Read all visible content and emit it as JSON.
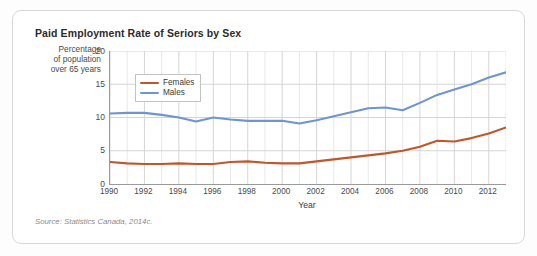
{
  "card": {
    "title": "Paid Employment Rate of Seriors by Sex",
    "source": "Source: Statistics Canada, 2014c."
  },
  "axes": {
    "y_caption": "Percentage of population over 65 years",
    "y_caption_lines": [
      "Percentage",
      "of population",
      "over 65 years"
    ],
    "x_title": "Year"
  },
  "legend": {
    "position": "inside-top-left",
    "entries": [
      {
        "label": "Females",
        "color": "#c0562c"
      },
      {
        "label": "Males",
        "color": "#6e95cf"
      }
    ]
  },
  "chart_data": {
    "type": "line",
    "title": "Paid Employment Rate of Seriors by Sex",
    "xlabel": "Year",
    "ylabel": "Percentage of population over 65 years",
    "xlim": [
      1990,
      2013
    ],
    "ylim": [
      0,
      20
    ],
    "yticks": [
      0,
      5,
      10,
      15,
      20
    ],
    "xticks": [
      1990,
      1992,
      1994,
      1996,
      1998,
      2000,
      2002,
      2004,
      2006,
      2008,
      2010,
      2012
    ],
    "x": [
      1990,
      1991,
      1992,
      1993,
      1994,
      1995,
      1996,
      1997,
      1998,
      1999,
      2000,
      2001,
      2002,
      2003,
      2004,
      2005,
      2006,
      2007,
      2008,
      2009,
      2010,
      2011,
      2012,
      2013
    ],
    "grid": true,
    "grid_minor_x": true,
    "legend": [
      "Females",
      "Males"
    ],
    "series": [
      {
        "name": "Females",
        "color": "#c0562c",
        "values": [
          3.3,
          3.1,
          3.0,
          3.0,
          3.1,
          3.0,
          3.0,
          3.3,
          3.4,
          3.2,
          3.1,
          3.1,
          3.4,
          3.7,
          4.0,
          4.3,
          4.6,
          5.0,
          5.6,
          6.5,
          6.4,
          6.9,
          7.6,
          8.5
        ]
      },
      {
        "name": "Males",
        "color": "#6e95cf",
        "values": [
          10.6,
          10.7,
          10.7,
          10.4,
          10.0,
          9.4,
          10.0,
          9.7,
          9.5,
          9.5,
          9.5,
          9.1,
          9.6,
          10.2,
          10.8,
          11.4,
          11.5,
          11.1,
          12.2,
          13.4,
          14.2,
          15.0,
          16.0,
          16.8
        ]
      }
    ]
  }
}
